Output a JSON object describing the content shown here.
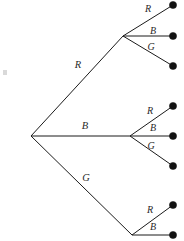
{
  "diagram": {
    "type": "tree",
    "width": 184,
    "height": 241,
    "background_color": "#ffffff",
    "line_color": "#1b1b1b",
    "dot_color": "#121212",
    "label_color": "#2a2a2a",
    "root": {
      "x": 31,
      "y": 136
    },
    "level1": [
      {
        "id": "r",
        "label": "R",
        "node": {
          "x": 123,
          "y": 36
        },
        "label_pos": {
          "x": 78,
          "y": 66
        }
      },
      {
        "id": "b",
        "label": "B",
        "node": {
          "x": 130,
          "y": 136
        },
        "label_pos": {
          "x": 85,
          "y": 127
        }
      },
      {
        "id": "g",
        "label": "G",
        "node": {
          "x": 132,
          "y": 235
        },
        "label_pos": {
          "x": 86,
          "y": 179
        }
      }
    ],
    "level2": [
      {
        "parent": "r",
        "label": "R",
        "leaf": {
          "x": 173,
          "y": 5
        },
        "label_pos": {
          "x": 148,
          "y": 10
        }
      },
      {
        "parent": "r",
        "label": "B",
        "leaf": {
          "x": 173,
          "y": 36
        },
        "label_pos": {
          "x": 153,
          "y": 32
        }
      },
      {
        "parent": "r",
        "label": "G",
        "leaf": {
          "x": 173,
          "y": 66
        },
        "label_pos": {
          "x": 151,
          "y": 48
        }
      },
      {
        "parent": "b",
        "label": "R",
        "leaf": {
          "x": 173,
          "y": 106
        },
        "label_pos": {
          "x": 150,
          "y": 112
        }
      },
      {
        "parent": "b",
        "label": "B",
        "leaf": {
          "x": 173,
          "y": 136
        },
        "label_pos": {
          "x": 153,
          "y": 129
        }
      },
      {
        "parent": "b",
        "label": "G",
        "leaf": {
          "x": 173,
          "y": 166
        },
        "label_pos": {
          "x": 151,
          "y": 147
        }
      },
      {
        "parent": "g",
        "label": "R",
        "leaf": {
          "x": 173,
          "y": 205
        },
        "label_pos": {
          "x": 150,
          "y": 211
        }
      },
      {
        "parent": "g",
        "label": "B",
        "leaf": {
          "x": 173,
          "y": 235
        },
        "label_pos": {
          "x": 153,
          "y": 228
        }
      }
    ],
    "labels": {
      "l1_r": "R",
      "l1_b": "B",
      "l1_g": "G",
      "r_r": "R",
      "r_b": "B",
      "r_g": "G",
      "b_r": "R",
      "b_b": "B",
      "b_g": "G",
      "g_r": "R",
      "g_b": "B"
    }
  }
}
